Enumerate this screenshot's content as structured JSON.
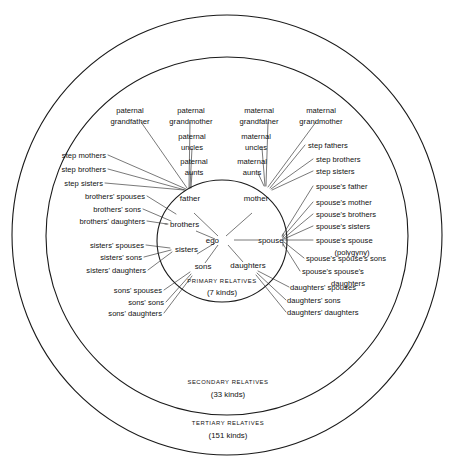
{
  "diagram": {
    "center_label": "ego",
    "rings": [
      {
        "id": "primary",
        "caption": "PRIMARY RELATIVES",
        "count": "(7 kinds)"
      },
      {
        "id": "secondary",
        "caption": "SECONDARY RELATIVES",
        "count": "(33 kinds)"
      },
      {
        "id": "tertiary",
        "caption": "TERTIARY RELATIVES",
        "count": "(151 kinds)"
      }
    ],
    "primary_relatives": [
      {
        "id": "father",
        "label": "father"
      },
      {
        "id": "mother",
        "label": "mother"
      },
      {
        "id": "brothers",
        "label": "brothers"
      },
      {
        "id": "sisters",
        "label": "sisters"
      },
      {
        "id": "sons",
        "label": "sons"
      },
      {
        "id": "daughters",
        "label": "daughters"
      },
      {
        "id": "spouse",
        "label": "spouse"
      }
    ],
    "secondary_top": [
      {
        "id": "paternal-grandfather",
        "line1": "paternal",
        "line2": "grandfather"
      },
      {
        "id": "paternal-grandmother",
        "line1": "paternal",
        "line2": "grandmother"
      },
      {
        "id": "maternal-grandfather",
        "line1": "maternal",
        "line2": "grandfather"
      },
      {
        "id": "maternal-grandmother",
        "line1": "maternal",
        "line2": "grandmother"
      }
    ],
    "secondary_inner_top": [
      {
        "id": "paternal-uncles",
        "line1": "paternal",
        "line2": "uncles"
      },
      {
        "id": "maternal-uncles",
        "line1": "maternal",
        "line2": "uncles"
      },
      {
        "id": "paternal-aunts",
        "line1": "paternal",
        "line2": "aunts"
      },
      {
        "id": "maternal-aunts",
        "line1": "maternal",
        "line2": "aunts"
      }
    ],
    "left_labels": [
      {
        "id": "step-mothers",
        "label": "step mothers"
      },
      {
        "id": "step-brothers-left",
        "label": "step brothers"
      },
      {
        "id": "step-sisters-left",
        "label": "step sisters"
      },
      {
        "id": "brothers-spouses",
        "label": "brothers' spouses"
      },
      {
        "id": "brothers-sons",
        "label": "brothers' sons"
      },
      {
        "id": "brothers-daughters",
        "label": "brothers' daughters"
      },
      {
        "id": "sisters-spouses",
        "label": "sisters' spouses"
      },
      {
        "id": "sisters-sons",
        "label": "sisters' sons"
      },
      {
        "id": "sisters-daughters",
        "label": "sisters' daughters"
      },
      {
        "id": "sons-spouses",
        "label": "sons' spouses"
      },
      {
        "id": "sons-sons",
        "label": "sons' sons"
      },
      {
        "id": "sons-daughters",
        "label": "sons' daughters"
      }
    ],
    "right_labels": [
      {
        "id": "step-fathers",
        "label": "step fathers"
      },
      {
        "id": "step-brothers-right",
        "label": "step brothers"
      },
      {
        "id": "step-sisters-right",
        "label": "step sisters"
      },
      {
        "id": "spouses-father",
        "label": "spouse's father"
      },
      {
        "id": "spouses-mother",
        "label": "spouse's mother"
      },
      {
        "id": "spouses-brothers",
        "label": "spouse's brothers"
      },
      {
        "id": "spouses-sisters",
        "label": "spouse's sisters"
      },
      {
        "id": "spouses-spouse",
        "label": "spouse's spouse"
      },
      {
        "id": "polygyny",
        "label": "(polygyny)"
      },
      {
        "id": "spouses-spouses-sons",
        "label": "spouse's spouse's sons"
      },
      {
        "id": "spouses-spouses-daughters-1",
        "label": "spouse's spouse's"
      },
      {
        "id": "spouses-spouses-daughters-2",
        "label": "daughters"
      },
      {
        "id": "daughters-spouses",
        "label": "daughters' spouses"
      },
      {
        "id": "daughters-sons",
        "label": "daughters' sons"
      },
      {
        "id": "daughters-daughters",
        "label": "daughters' daughters"
      }
    ],
    "colors": {
      "ink": "#111111",
      "line": "#262626",
      "ring": "#1a1a1a",
      "background": "#ffffff"
    }
  }
}
